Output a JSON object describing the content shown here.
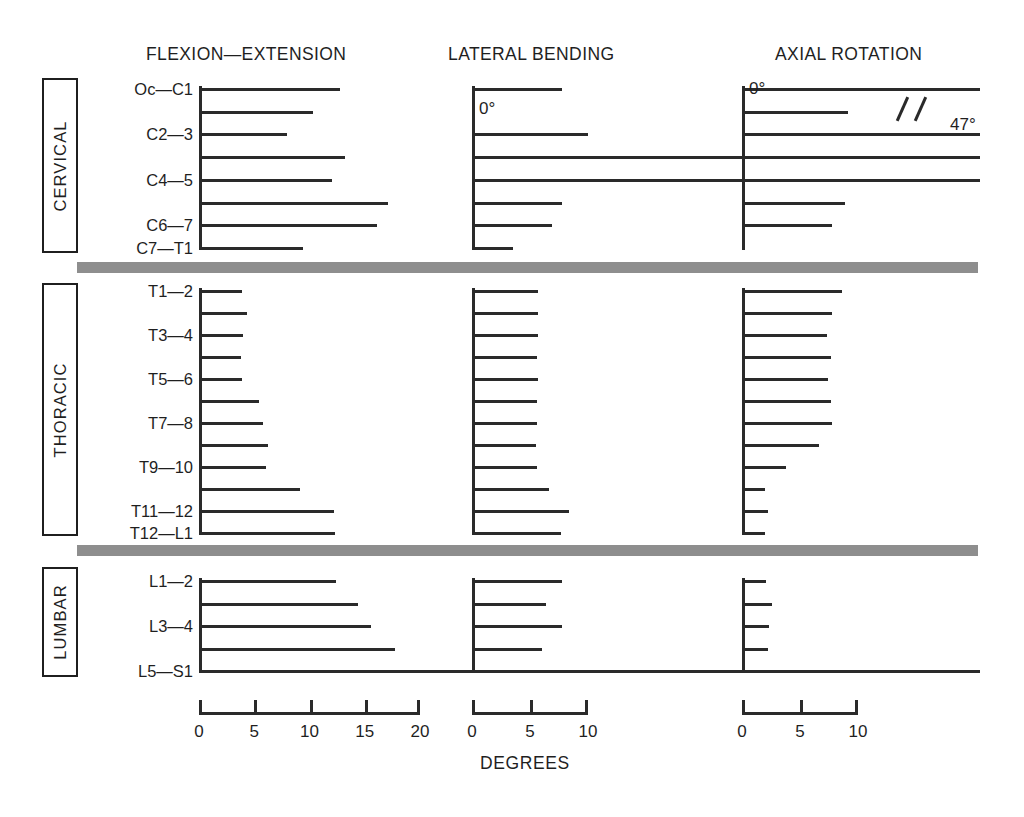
{
  "figure": {
    "axis_caption": "DEGREES",
    "panel_titles": [
      "FLEXION—EXTENSION",
      "LATERAL BENDING",
      "AXIAL ROTATION"
    ],
    "zero_labels": [
      "0°",
      "0°"
    ],
    "break_value_label": "47°",
    "sections": [
      "CERVICAL",
      "THORACIC",
      "LUMBAR"
    ]
  },
  "chart_data": {
    "type": "bar",
    "xlabel": "DEGREES",
    "ylabel": "",
    "orientation": "horizontal",
    "grid": false,
    "legend": null,
    "panels": [
      {
        "name": "FLEXION—EXTENSION",
        "xlim": [
          0,
          20
        ],
        "xticks": [
          0,
          5,
          10,
          15,
          20
        ],
        "xticklabels": [
          "0",
          "5",
          "10",
          "15",
          "20"
        ],
        "sections": [
          {
            "name": "CERVICAL",
            "categories": [
              "Oc—C1",
              "C1—2",
              "C2—3",
              "C3—4",
              "C4—5",
              "C5—6",
              "C6—7",
              "C7—T1"
            ],
            "labeled_categories": [
              "Oc—C1",
              "",
              "C2—3",
              "",
              "C4—5",
              "",
              "C6—7",
              "C7—T1"
            ],
            "values": [
              12.8,
              10.3,
              8.0,
              13.2,
              12.0,
              17.1,
              16.1,
              9.4
            ]
          },
          {
            "name": "THORACIC",
            "categories": [
              "T1—2",
              "T2—3",
              "T3—4",
              "T4—5",
              "T5—6",
              "T6—7",
              "T7—8",
              "T8—9",
              "T9—10",
              "T10—11",
              "T11—12",
              "T12—L1"
            ],
            "labeled_categories": [
              "T1—2",
              "",
              "T3—4",
              "",
              "T5—6",
              "",
              "T7—8",
              "",
              "T9—10",
              "",
              "T11—12",
              "T12—L1"
            ],
            "values": [
              3.9,
              4.3,
              4.0,
              3.8,
              3.9,
              5.4,
              5.8,
              6.2,
              6.1,
              9.1,
              12.2,
              12.3
            ]
          },
          {
            "name": "LUMBAR",
            "categories": [
              "L1—2",
              "L2—3",
              "L3—4",
              "L4—5",
              "L5—S1"
            ],
            "labeled_categories": [
              "L1—2",
              "",
              "L3—4",
              "",
              "L5—S1"
            ],
            "values": [
              12.4,
              14.4,
              15.6,
              17.7,
              20.9
            ]
          }
        ]
      },
      {
        "name": "LATERAL BENDING",
        "xlim": [
          0,
          10
        ],
        "xticks": [
          0,
          5,
          10
        ],
        "xticklabels": [
          "0",
          "5",
          "10"
        ],
        "sections": [
          {
            "name": "CERVICAL",
            "categories": [
              "Oc—C1",
              "C1—2",
              "C2—3",
              "C3—4",
              "C4—5",
              "C5—6",
              "C6—7",
              "C7—T1"
            ],
            "labeled_categories": [
              "Oc—C1",
              "",
              "C2—3",
              "",
              "C4—5",
              "",
              "C6—7",
              "C7—T1"
            ],
            "values": [
              7.8,
              0,
              10.0,
              11.2,
              11.0,
              7.8,
              6.9,
              3.5
            ]
          },
          {
            "name": "THORACIC",
            "categories": [
              "T1—2",
              "T2—3",
              "T3—4",
              "T4—5",
              "T5—6",
              "T6—7",
              "T7—8",
              "T8—9",
              "T9—10",
              "T10—11",
              "T11—12",
              "T12—L1"
            ],
            "labeled_categories": [
              "T1—2",
              "",
              "T3—4",
              "",
              "T5—6",
              "",
              "T7—8",
              "",
              "T9—10",
              "",
              "T11—12",
              "T12—L1"
            ],
            "values": [
              5.7,
              5.7,
              5.7,
              5.6,
              5.7,
              5.6,
              5.6,
              5.5,
              5.6,
              6.6,
              8.4,
              7.7
            ]
          },
          {
            "name": "LUMBAR",
            "categories": [
              "L1—2",
              "L2—3",
              "L3—4",
              "L4—5",
              "L5—S1"
            ],
            "labeled_categories": [
              "L1—2",
              "",
              "L3—4",
              "",
              "L5—S1"
            ],
            "values": [
              7.8,
              6.4,
              7.8,
              6.0,
              2.9
            ]
          }
        ]
      },
      {
        "name": "AXIAL ROTATION",
        "xlim": [
          0,
          10
        ],
        "xticks": [
          0,
          5,
          10
        ],
        "xticklabels": [
          "0",
          "5",
          "10"
        ],
        "sections": [
          {
            "name": "CERVICAL",
            "categories": [
              "Oc—C1",
              "C1—2",
              "C2—3",
              "C3—4",
              "C4—5",
              "C5—6",
              "C6—7",
              "C7—T1"
            ],
            "labeled_categories": [
              "Oc—C1",
              "",
              "C2—3",
              "",
              "C4—5",
              "",
              "C6—7",
              "C7—T1"
            ],
            "values": [
              47.0,
              9.1,
              10.8,
              12.2,
              10.2,
              8.9,
              7.8,
              0
            ],
            "note": "Top bar (C1—2) is off-scale at 47° and drawn with an axis-break mark."
          },
          {
            "name": "THORACIC",
            "categories": [
              "T1—2",
              "T2—3",
              "T3—4",
              "T4—5",
              "T5—6",
              "T6—7",
              "T7—8",
              "T8—9",
              "T9—10",
              "T10—11",
              "T11—12",
              "T12—L1"
            ],
            "labeled_categories": [
              "T1—2",
              "",
              "T3—4",
              "",
              "T5—6",
              "",
              "T7—8",
              "",
              "T9—10",
              "",
              "T11—12",
              "T12—L1"
            ],
            "values": [
              8.6,
              7.8,
              7.3,
              7.7,
              7.4,
              7.7,
              7.8,
              6.6,
              3.8,
              2.0,
              2.2,
              2.0
            ]
          },
          {
            "name": "LUMBAR",
            "categories": [
              "L1—2",
              "L2—3",
              "L3—4",
              "L4—5",
              "L5—S1"
            ],
            "labeled_categories": [
              "L1—2",
              "",
              "L3—4",
              "",
              "L5—S1"
            ],
            "values": [
              2.1,
              2.6,
              2.3,
              2.2,
              5.0
            ]
          }
        ]
      }
    ]
  }
}
